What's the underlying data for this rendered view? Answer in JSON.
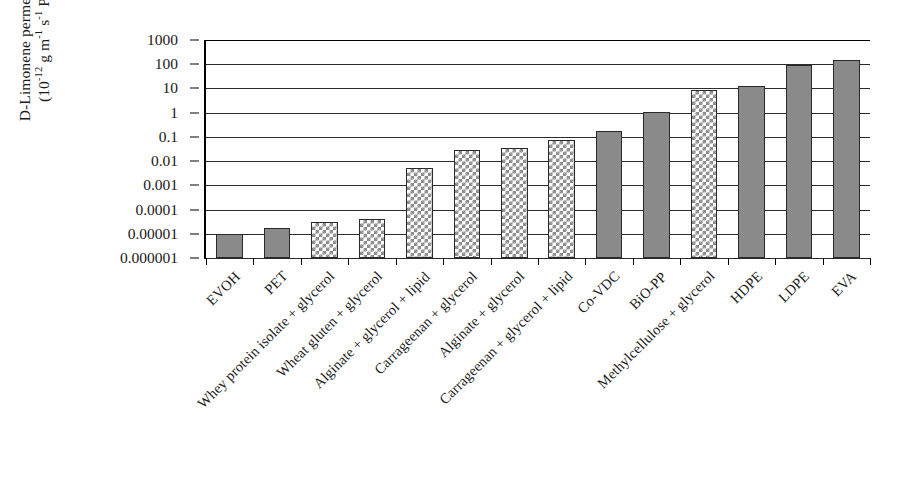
{
  "chart_data": {
    "type": "bar",
    "title": "",
    "xlabel": "",
    "ylabel": "D-Limonene permeability (10^-12 g m^-1 s^-1 Pa^-1)",
    "ylabel_line1": "D-Limonene permeability",
    "ylabel_line2_prefix": "(10",
    "ylabel_exp1": "-12",
    "ylabel_line2_mid1": " g m",
    "ylabel_exp2": "-1",
    "ylabel_line2_mid2": " s",
    "ylabel_exp3": "-1",
    "ylabel_line2_mid3": " Pa",
    "ylabel_exp4": "-1",
    "ylabel_line2_suffix": ")",
    "scale": "log",
    "ylim": [
      1e-06,
      1000
    ],
    "grid": true,
    "legend": "none",
    "ytick_labels": [
      "1000",
      "100",
      "10",
      "1",
      "0.1",
      "0.01",
      "0.001",
      "0.0001",
      "0.00001",
      "0.000001"
    ],
    "ytick_values": [
      1000,
      100,
      10,
      1,
      0.1,
      0.01,
      0.001,
      0.0001,
      1e-05,
      1e-06
    ],
    "categories": [
      "EVOH",
      "PET",
      "Whey protein isolate + glycerol",
      "Wheat gluten + glycerol",
      "Alginate + glycerol + lipid",
      "Carrageenan + glycerol",
      "Alginate + glycerol",
      "Carrageenan + glycerol + lipid",
      "Co-VDC",
      "BiO-PP",
      "Methylcellulose + glycerol",
      "HDPE",
      "LDPE",
      "EVA"
    ],
    "values": [
      1e-05,
      1.7e-05,
      3e-05,
      4e-05,
      0.005,
      0.03,
      0.035,
      0.075,
      0.18,
      1.1,
      9,
      13,
      90,
      150
    ],
    "bar_styles": [
      "solid",
      "solid",
      "check",
      "check",
      "check",
      "check",
      "check",
      "check",
      "solid",
      "solid",
      "check",
      "solid",
      "solid",
      "solid"
    ],
    "colors": {
      "bar_fill": "#8a8a8a",
      "bar_edge": "#2a2a2a",
      "grid": "#2b2b2b",
      "axis": "#000000",
      "background": "#ffffff"
    }
  }
}
